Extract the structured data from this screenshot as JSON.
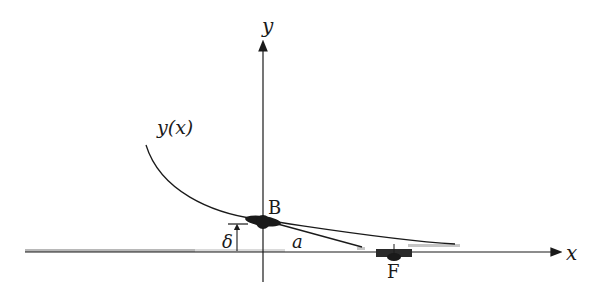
{
  "diagram": {
    "labels": {
      "y_axis": "y",
      "x_axis": "x",
      "curve": "y(x)",
      "point_b": "B",
      "point_f": "F",
      "delta": "δ",
      "a": "a"
    },
    "colors": {
      "ink": "#1a1a1a",
      "grey_noise": "#8a8a8a",
      "background": "#ffffff"
    }
  }
}
